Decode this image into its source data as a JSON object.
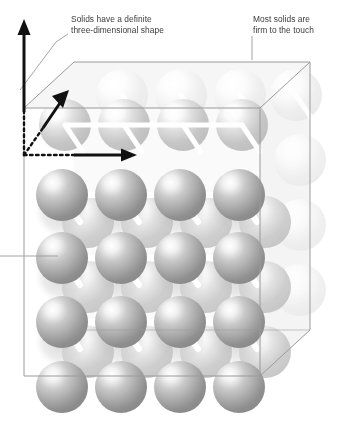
{
  "figure": {
    "annotations": {
      "shape": "Solids have a definite\nthree-dimensional shape",
      "touch": "Most solids are\nfirm to the touch"
    },
    "axes": {
      "vertical_label": "height-axis",
      "diagonal_label": "depth-axis",
      "horizontal_label": "width-axis"
    },
    "lattice": {
      "columns": 4,
      "rows": 5,
      "depth_layers": 3,
      "description": "Close-packed spheres joined by rods inside a transparent cube"
    },
    "colors": {
      "sphere_front_light": "#ffffff",
      "sphere_front_mid": "#b9b9b9",
      "sphere_front_dark": "#8e8e8e",
      "sphere_mid_layer": "#cfcfcf",
      "sphere_back_layer": "#ededed",
      "rod": "#ffffff",
      "box_stroke": "#9a9a9a",
      "box_face": "#f7f7f7",
      "axis": "#111111",
      "leader": "#9a9a9a",
      "text": "#3b3b3b",
      "background": "#ffffff"
    }
  }
}
